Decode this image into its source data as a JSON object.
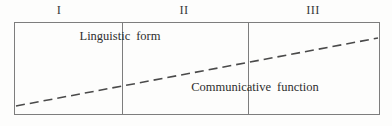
{
  "diagram": {
    "type": "schematic-band-diagram",
    "stages": [
      {
        "id": "stage-1",
        "label": "I",
        "center_x_px": 59,
        "range_px": [
          14,
          122
        ]
      },
      {
        "id": "stage-2",
        "label": "II",
        "center_x_px": 184,
        "range_px": [
          122,
          248
        ]
      },
      {
        "id": "stage-3",
        "label": "III",
        "center_x_px": 313,
        "range_px": [
          248,
          380
        ]
      }
    ],
    "captions": [
      {
        "id": "caption-linguistic-form",
        "word_1": "Linguistic",
        "word_2": "form",
        "position_px": {
          "x": 120,
          "y": 29
        }
      },
      {
        "id": "caption-communicative-function",
        "word_1": "Communicative",
        "word_2": "function",
        "position_px": {
          "x": 255,
          "y": 80
        }
      }
    ],
    "trend_line": {
      "style": "dashed",
      "start_px": {
        "x": 16,
        "y": 106
      },
      "end_px": {
        "x": 378,
        "y": 38
      },
      "dash_length_px": 9,
      "dash_gap_px": 5,
      "stroke_width_px": 1.6
    },
    "frame": {
      "left_px": 14,
      "top_px": 22,
      "width_px": 366,
      "height_px": 93
    },
    "dividers_x_px": [
      122,
      248
    ],
    "colors": {
      "background": "#fdfdfc",
      "line": "#7d7d7d",
      "trend": "#4a4a4a",
      "text": "#2e2e2e",
      "stage_text": "#3a3a3a"
    }
  }
}
